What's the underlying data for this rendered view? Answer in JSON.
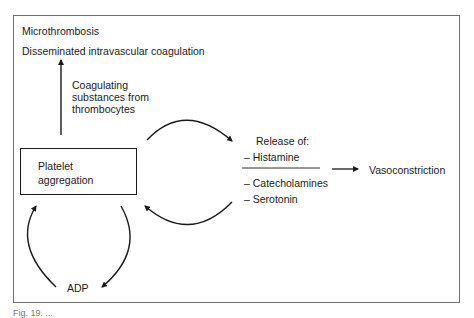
{
  "diagram": {
    "outcome_top": "Microthrombosis",
    "outcome_bottom": "Disseminated intravascular coagulation",
    "coag_label_lines": [
      "Coagulating",
      "substances from",
      "thrombocytes"
    ],
    "central_box_lines": [
      "Platelet",
      "aggregation"
    ],
    "release_title": "Release of:",
    "release_items": [
      "– Histamine",
      "– Catecholamines",
      "– Serotonin"
    ],
    "effect": "Vasoconstriction",
    "feedback_agent": "ADP"
  },
  "caption": "Fig. 19. ..."
}
